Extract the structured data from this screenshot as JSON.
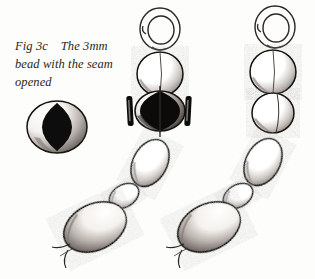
{
  "figure": {
    "id": "fig-3c",
    "caption_lines": [
      "Fig 3c    The 3mm",
      "bead with the seam",
      "opened"
    ],
    "caption_full": "Fig 3c    The 3mm bead with the seam opened",
    "label": "Fig 3c",
    "subject": "The 3mm bead with the seam opened",
    "medium": "pen-and-ink line drawing",
    "style": "hand-stippled black ink on white paper"
  },
  "colors": {
    "background": "#fdfdfb",
    "ink": "#151210",
    "ink_soft": "#3a3430",
    "stipple": "#6b6460",
    "fill_black": "#0d0b0a",
    "highlight": "#ffffff",
    "caption_text": "#2a2622"
  },
  "detail_inset": {
    "name": "opened-seam-bead-detail",
    "description": "Round 3mm bead seen end-on with its seam split open, the opening rendered as a solid black almond shape",
    "center": {
      "x": 57,
      "y": 127
    },
    "outer_radius_x": 30,
    "outer_radius_y": 26,
    "lens_half_width": 15,
    "lens_half_height": 24
  },
  "chains": [
    {
      "name": "chain-left",
      "has_opened_seam_bead": true,
      "jump_ring": {
        "name": "jump-ring",
        "center": {
          "x": 160,
          "y": 29
        },
        "outer_rx": 20,
        "outer_ry": 21,
        "inner_rx": 13,
        "inner_ry": 14,
        "gap_side": "left"
      },
      "beads": [
        {
          "name": "round-bead-top",
          "shape": "round",
          "cx": 160,
          "cy": 74,
          "rx": 23,
          "ry": 22,
          "rotation": 0,
          "fill": "outline",
          "seam": true
        },
        {
          "name": "opened-seam-bead",
          "shape": "round",
          "cx": 160,
          "cy": 111,
          "rx": 25,
          "ry": 20,
          "rotation": 0,
          "fill": "black",
          "seam": true,
          "markers": true
        },
        {
          "name": "oval-bead-1",
          "shape": "oval",
          "cx": 150,
          "cy": 163,
          "rx": 17,
          "ry": 25,
          "rotation": 28,
          "fill": "outline",
          "seam": false
        },
        {
          "name": "small-oval-bead",
          "shape": "oval",
          "cx": 124,
          "cy": 196,
          "rx": 11,
          "ry": 16,
          "rotation": 58,
          "fill": "outline",
          "seam": false
        },
        {
          "name": "oval-bead-large",
          "shape": "oval",
          "cx": 95,
          "cy": 227,
          "rx": 23,
          "ry": 33,
          "rotation": 64,
          "fill": "outline",
          "seam": false
        }
      ],
      "tail": {
        "name": "thread-tail",
        "x": 62,
        "y": 249
      }
    },
    {
      "name": "chain-right",
      "has_opened_seam_bead": false,
      "jump_ring": {
        "name": "jump-ring",
        "center": {
          "x": 275,
          "y": 27
        },
        "outer_rx": 20,
        "outer_ry": 21,
        "inner_rx": 13,
        "inner_ry": 14,
        "gap_side": "left"
      },
      "beads": [
        {
          "name": "round-bead-top",
          "shape": "round",
          "cx": 273,
          "cy": 72,
          "rx": 23,
          "ry": 22,
          "rotation": 0,
          "fill": "outline",
          "seam": true
        },
        {
          "name": "round-bead-second",
          "shape": "round",
          "cx": 273,
          "cy": 113,
          "rx": 21,
          "ry": 20,
          "rotation": 0,
          "fill": "outline",
          "seam": true
        },
        {
          "name": "oval-bead-1",
          "shape": "oval",
          "cx": 263,
          "cy": 162,
          "rx": 17,
          "ry": 25,
          "rotation": 28,
          "fill": "outline",
          "seam": false
        },
        {
          "name": "small-oval-bead",
          "shape": "oval",
          "cx": 238,
          "cy": 196,
          "rx": 11,
          "ry": 16,
          "rotation": 58,
          "fill": "outline",
          "seam": false
        },
        {
          "name": "oval-bead-large",
          "shape": "oval",
          "cx": 209,
          "cy": 227,
          "rx": 23,
          "ry": 33,
          "rotation": 64,
          "fill": "outline",
          "seam": false
        }
      ],
      "tail": {
        "name": "thread-tail",
        "x": 176,
        "y": 249
      }
    }
  ],
  "seam_markers": [
    {
      "name": "seam-marker-left",
      "x": 127,
      "y": 96,
      "width": 6,
      "height": 30,
      "rotation": -3
    },
    {
      "name": "seam-marker-right",
      "x": 185,
      "y": 96,
      "width": 6,
      "height": 30,
      "rotation": 3
    }
  ]
}
